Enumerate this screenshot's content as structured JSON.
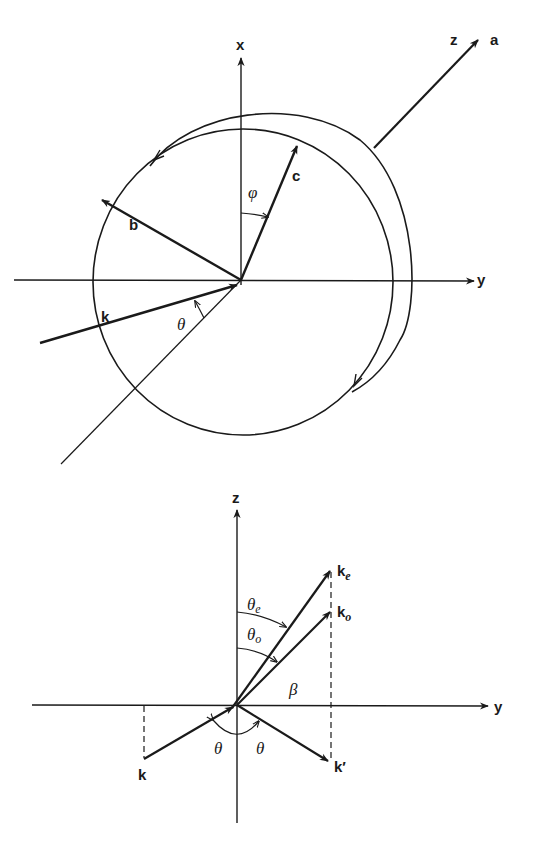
{
  "top_diagram": {
    "axis_labels": {
      "x": "x",
      "y": "y",
      "z": "z"
    },
    "vector_labels": {
      "a": "a",
      "b": "b",
      "c": "c",
      "k": "k"
    },
    "angle_labels": {
      "phi": "φ",
      "theta": "θ"
    }
  },
  "bottom_diagram": {
    "axis_labels": {
      "z": "z",
      "y": "y"
    },
    "vector_labels": {
      "k": "k",
      "k_prime": "k′",
      "k_e": "k",
      "k_e_sub": "e",
      "k_o": "k",
      "k_o_sub": "o"
    },
    "angle_labels": {
      "theta_e": "θ",
      "theta_e_sub": "e",
      "theta_o": "θ",
      "theta_o_sub": "o",
      "beta": "β",
      "theta_left": "θ",
      "theta_right": "θ"
    }
  },
  "colors": {
    "ink": "#1a1a1a",
    "background": "#ffffff"
  }
}
